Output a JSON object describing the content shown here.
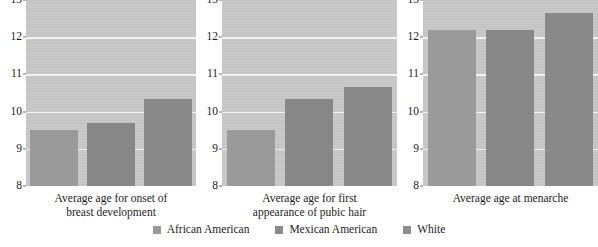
{
  "chart_data": {
    "type": "bar",
    "title": "",
    "subtitle": "",
    "xlabel": "",
    "ylabel": "",
    "ylim": [
      8,
      13
    ],
    "yticks": [
      8,
      9,
      10,
      11,
      12,
      13
    ],
    "grid": true,
    "legend_position": "bottom",
    "categories": [
      "African American",
      "Mexican American",
      "White"
    ],
    "panels": [
      {
        "caption_line1": "Average age for onset of",
        "caption_line2": "breast development",
        "values": [
          9.5,
          9.7,
          10.35
        ]
      },
      {
        "caption_line1": "Average age for first",
        "caption_line2": "appearance of pubic hair",
        "values": [
          9.5,
          10.35,
          10.65
        ]
      },
      {
        "caption_line1": "Average age at menarche",
        "caption_line2": "",
        "values": [
          12.2,
          12.2,
          12.65
        ]
      }
    ],
    "series": [
      {
        "name": "African American",
        "values": [
          9.5,
          9.5,
          12.2
        ]
      },
      {
        "name": "Mexican American",
        "values": [
          9.7,
          10.35,
          12.2
        ]
      },
      {
        "name": "White",
        "values": [
          10.35,
          10.65,
          12.65
        ]
      }
    ]
  },
  "colors": {
    "plot_background": "#c8c8c8",
    "gridline": "#f2f2f2",
    "bar_african_american": "#9a9a9a",
    "bar_mexican_american": "#8a8a8a",
    "bar_white": "#8d8d8d",
    "text": "#1c1c1c",
    "page_background": "#ffffff"
  }
}
